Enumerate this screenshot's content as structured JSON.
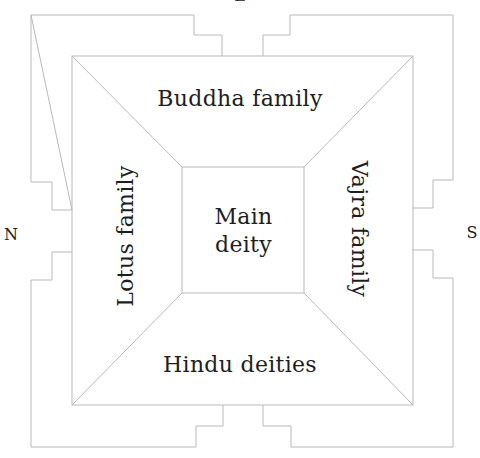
{
  "diagram": {
    "type": "mandala-layout",
    "regions": {
      "top": "Buddha family",
      "bottom": "Hindu deities",
      "left": "Lotus family",
      "right": "Vajra family",
      "center": "Main deity"
    },
    "center_lines": [
      "Main",
      "deity"
    ],
    "directions": {
      "left": "N",
      "right": "S",
      "top": "E"
    },
    "colors": {
      "line": "#b9b9b9",
      "text": "#1e1e1e",
      "background": "#ffffff"
    }
  }
}
